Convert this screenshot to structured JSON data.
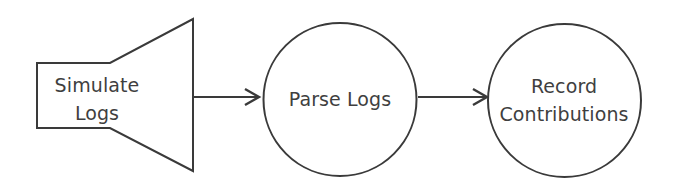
{
  "diagram": {
    "background_color": "#ffffff",
    "stroke_color": "#3a3a3a",
    "text_color": "#3f3f3f",
    "nodes": [
      {
        "id": "simulate-logs",
        "shape": "horn",
        "label_line1": "Simulate",
        "label_line2": "Logs"
      },
      {
        "id": "parse-logs",
        "shape": "circle",
        "label_line1": "Parse Logs",
        "label_line2": ""
      },
      {
        "id": "record-contributions",
        "shape": "circle",
        "label_line1": "Record",
        "label_line2": "Contributions"
      }
    ],
    "connectors": [
      {
        "id": "simulate-to-parse",
        "from": "simulate-logs",
        "to": "parse-logs",
        "label": ""
      },
      {
        "id": "parse-to-record",
        "from": "parse-logs",
        "to": "record-contributions",
        "label": ""
      }
    ]
  }
}
